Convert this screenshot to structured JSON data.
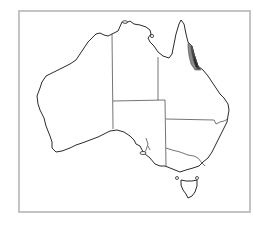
{
  "map": {
    "subject": "Australia",
    "features": [
      "state-borders",
      "highlighted-region"
    ],
    "highlighted_region": {
      "location": "northeast Queensland coast",
      "fill_color": "#4a4a4a"
    },
    "colors": {
      "frame": "#c4c4c4",
      "coastline": "#2a2a2a",
      "background": "#ffffff"
    }
  }
}
